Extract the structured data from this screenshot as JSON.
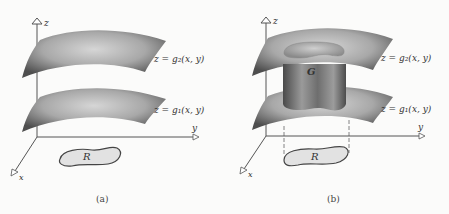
{
  "figure": {
    "panels": [
      {
        "id": "a",
        "caption": "(a)",
        "axes": {
          "z": "z",
          "y": "y",
          "x": "x"
        },
        "upper_surface_label": "z = g₂(x, y)",
        "lower_surface_label": "z = g₁(x, y)",
        "region_label": "R"
      },
      {
        "id": "b",
        "caption": "(b)",
        "axes": {
          "z": "z",
          "y": "y",
          "x": "x"
        },
        "upper_surface_label": "z = g₂(x, y)",
        "lower_surface_label": "z = g₁(x, y)",
        "solid_label": "G",
        "region_label": "R"
      }
    ]
  },
  "colors": {
    "surface_dark": "#5a5a5a",
    "surface_light": "#d4d4d4",
    "region_fill": "#e2e2e2",
    "axis": "#555555",
    "background": "#fbfbfa"
  }
}
